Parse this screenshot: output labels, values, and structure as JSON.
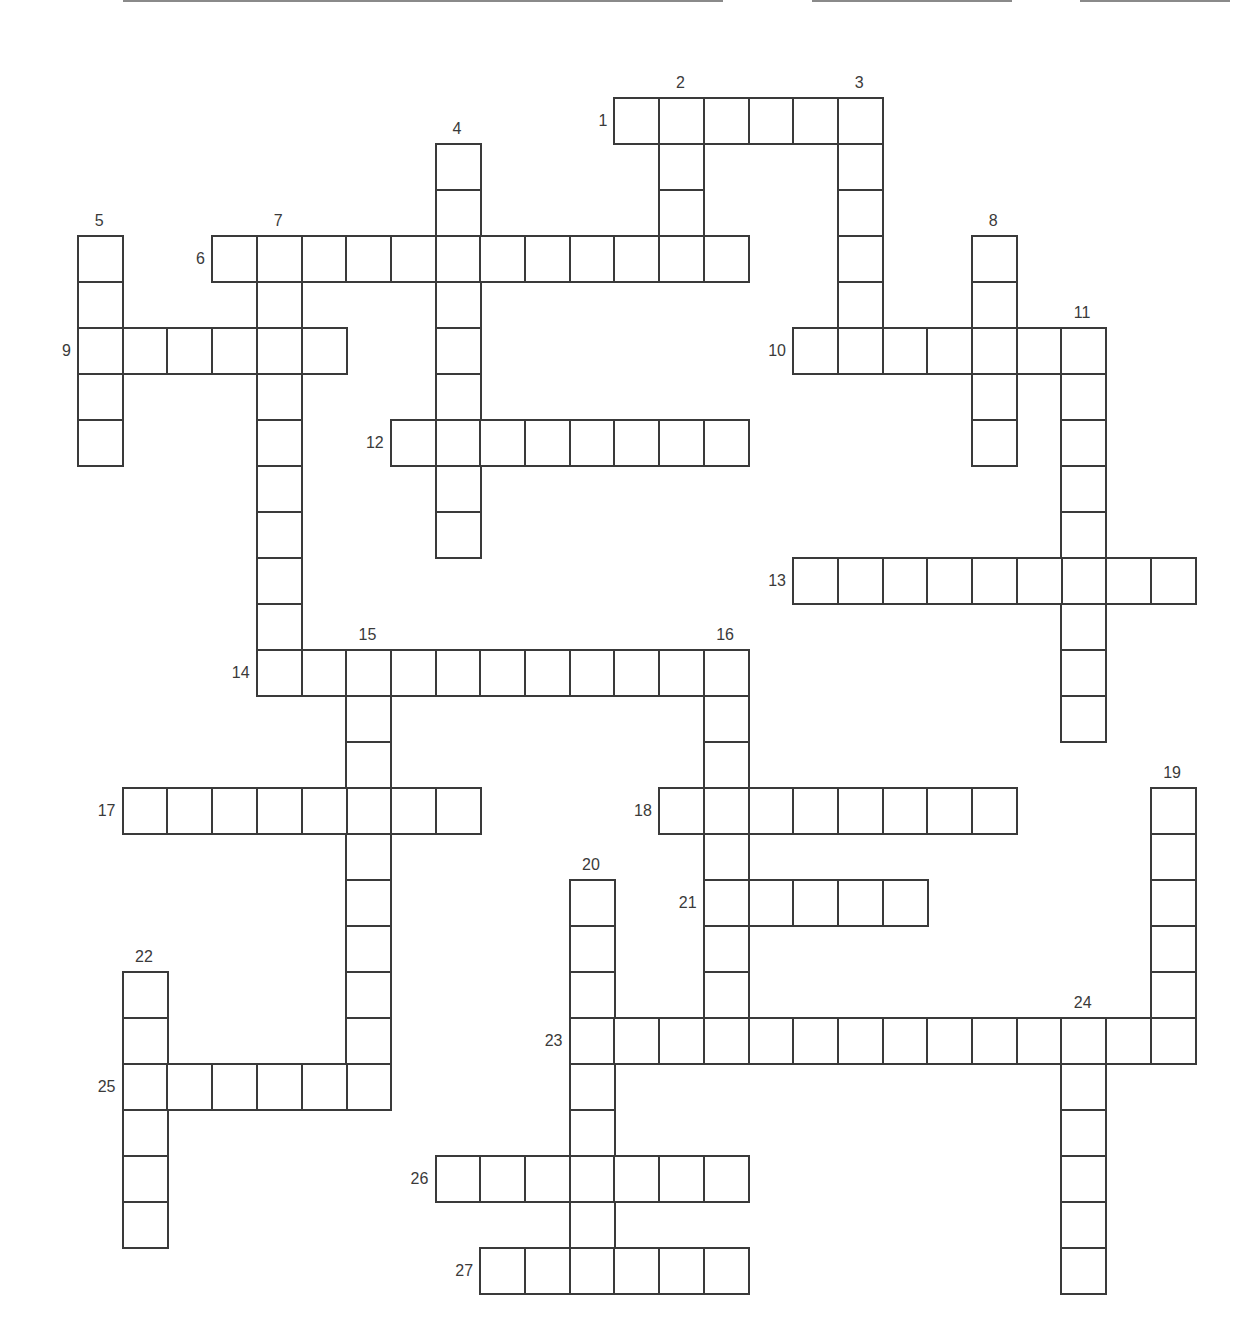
{
  "puzzle": {
    "type": "crossword",
    "grid": {
      "origin_x": 77,
      "origin_y": 97,
      "pitch_x": 44.7,
      "pitch_y": 46.0
    },
    "header_lines": [
      {
        "name": "name-line",
        "left": 123,
        "width": 600
      },
      {
        "name": "date-line",
        "left": 812,
        "width": 200
      },
      {
        "name": "period-line",
        "left": 1080,
        "width": 150
      }
    ],
    "entries": [
      {
        "number": "1",
        "direction": "across",
        "row": 0,
        "col": 12,
        "length": 6
      },
      {
        "number": "2",
        "direction": "down",
        "row": 0,
        "col": 13,
        "length": 4
      },
      {
        "number": "3",
        "direction": "down",
        "row": 0,
        "col": 17,
        "length": 6
      },
      {
        "number": "4",
        "direction": "down",
        "row": 1,
        "col": 8,
        "length": 9
      },
      {
        "number": "5",
        "direction": "down",
        "row": 3,
        "col": 0,
        "length": 5
      },
      {
        "number": "6",
        "direction": "across",
        "row": 3,
        "col": 3,
        "length": 12
      },
      {
        "number": "7",
        "direction": "down",
        "row": 3,
        "col": 4,
        "length": 10
      },
      {
        "number": "8",
        "direction": "down",
        "row": 3,
        "col": 20,
        "length": 5
      },
      {
        "number": "9",
        "direction": "across",
        "row": 5,
        "col": 0,
        "length": 6
      },
      {
        "number": "10",
        "direction": "across",
        "row": 5,
        "col": 16,
        "length": 7
      },
      {
        "number": "11",
        "direction": "down",
        "row": 5,
        "col": 22,
        "length": 9
      },
      {
        "number": "12",
        "direction": "across",
        "row": 7,
        "col": 7,
        "length": 8
      },
      {
        "number": "13",
        "direction": "across",
        "row": 10,
        "col": 16,
        "length": 9
      },
      {
        "number": "14",
        "direction": "across",
        "row": 12,
        "col": 4,
        "length": 11
      },
      {
        "number": "15",
        "direction": "down",
        "row": 12,
        "col": 6,
        "length": 10
      },
      {
        "number": "16",
        "direction": "down",
        "row": 12,
        "col": 14,
        "length": 9
      },
      {
        "number": "17",
        "direction": "across",
        "row": 15,
        "col": 1,
        "length": 8
      },
      {
        "number": "18",
        "direction": "across",
        "row": 15,
        "col": 13,
        "length": 8
      },
      {
        "number": "19",
        "direction": "down",
        "row": 15,
        "col": 24,
        "length": 6
      },
      {
        "number": "20",
        "direction": "down",
        "row": 17,
        "col": 11,
        "length": 8
      },
      {
        "number": "21",
        "direction": "across",
        "row": 17,
        "col": 14,
        "length": 5
      },
      {
        "number": "22",
        "direction": "down",
        "row": 19,
        "col": 1,
        "length": 6
      },
      {
        "number": "23",
        "direction": "across",
        "row": 20,
        "col": 11,
        "length": 14
      },
      {
        "number": "24",
        "direction": "down",
        "row": 20,
        "col": 22,
        "length": 6
      },
      {
        "number": "25",
        "direction": "across",
        "row": 21,
        "col": 1,
        "length": 6
      },
      {
        "number": "26",
        "direction": "across",
        "row": 23,
        "col": 8,
        "length": 7
      },
      {
        "number": "27",
        "direction": "across",
        "row": 25,
        "col": 9,
        "length": 6
      }
    ]
  }
}
